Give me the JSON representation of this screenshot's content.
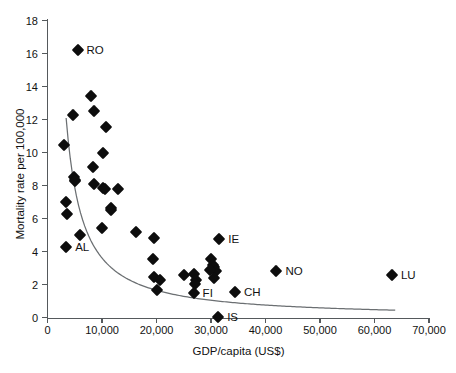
{
  "chart_data": {
    "type": "scatter",
    "title": "",
    "xlabel": "GDP/capita (US$)",
    "ylabel": "Mortality rate per 100,000",
    "xlim": [
      0,
      70000
    ],
    "ylim": [
      0,
      18
    ],
    "xticks": [
      0,
      10000,
      20000,
      30000,
      40000,
      50000,
      60000,
      70000
    ],
    "xticklabels": [
      "0",
      "10,000",
      "20,000",
      "30,000",
      "40,000",
      "50,000",
      "60,000",
      "70,000"
    ],
    "yticks": [
      0,
      2,
      4,
      6,
      8,
      10,
      12,
      14,
      16,
      18
    ],
    "yticklabels": [
      "0",
      "2",
      "4",
      "6",
      "8",
      "10",
      "12",
      "14",
      "16",
      "18"
    ],
    "grid": false,
    "legend": null,
    "marker": "diamond",
    "marker_color": "#0d0d0d",
    "trendline": {
      "style": "power-decay curve",
      "color": "#6b6f72",
      "x_start": 3400,
      "y_start": 12.1,
      "x_end": 63800,
      "y_end": 0.45
    },
    "points": [
      {
        "x": 3100,
        "y": 10.45,
        "label": ""
      },
      {
        "x": 3300,
        "y": 7.0,
        "label": ""
      },
      {
        "x": 3500,
        "y": 6.3,
        "label": ""
      },
      {
        "x": 3400,
        "y": 4.25,
        "label": "AL"
      },
      {
        "x": 5500,
        "y": 16.2,
        "label": "RO"
      },
      {
        "x": 4700,
        "y": 12.3,
        "label": ""
      },
      {
        "x": 4800,
        "y": 8.5,
        "label": ""
      },
      {
        "x": 5000,
        "y": 8.35,
        "label": ""
      },
      {
        "x": 5100,
        "y": 8.25,
        "label": ""
      },
      {
        "x": 5900,
        "y": 5.0,
        "label": ""
      },
      {
        "x": 8000,
        "y": 13.45,
        "label": ""
      },
      {
        "x": 8500,
        "y": 12.5,
        "label": ""
      },
      {
        "x": 8300,
        "y": 9.1,
        "label": ""
      },
      {
        "x": 8600,
        "y": 8.1,
        "label": ""
      },
      {
        "x": 9900,
        "y": 5.45,
        "label": ""
      },
      {
        "x": 10700,
        "y": 11.55,
        "label": ""
      },
      {
        "x": 10200,
        "y": 7.85,
        "label": ""
      },
      {
        "x": 10600,
        "y": 7.8,
        "label": ""
      },
      {
        "x": 10100,
        "y": 9.95,
        "label": ""
      },
      {
        "x": 11600,
        "y": 6.65,
        "label": ""
      },
      {
        "x": 11700,
        "y": 6.55,
        "label": ""
      },
      {
        "x": 12900,
        "y": 7.8,
        "label": ""
      },
      {
        "x": 16200,
        "y": 5.2,
        "label": ""
      },
      {
        "x": 19500,
        "y": 4.8,
        "label": ""
      },
      {
        "x": 19400,
        "y": 3.55,
        "label": ""
      },
      {
        "x": 19600,
        "y": 2.45,
        "label": ""
      },
      {
        "x": 20600,
        "y": 2.25,
        "label": ""
      },
      {
        "x": 20000,
        "y": 1.65,
        "label": ""
      },
      {
        "x": 25100,
        "y": 2.6,
        "label": ""
      },
      {
        "x": 26900,
        "y": 2.65,
        "label": ""
      },
      {
        "x": 27200,
        "y": 2.25,
        "label": ""
      },
      {
        "x": 27100,
        "y": 2.05,
        "label": ""
      },
      {
        "x": 26800,
        "y": 1.5,
        "label": "FI"
      },
      {
        "x": 29900,
        "y": 3.55,
        "label": ""
      },
      {
        "x": 30300,
        "y": 3.2,
        "label": ""
      },
      {
        "x": 30500,
        "y": 3.05,
        "label": ""
      },
      {
        "x": 30900,
        "y": 2.85,
        "label": ""
      },
      {
        "x": 30600,
        "y": 2.4,
        "label": ""
      },
      {
        "x": 29800,
        "y": 2.9,
        "label": ""
      },
      {
        "x": 31500,
        "y": 4.75,
        "label": "IE"
      },
      {
        "x": 31300,
        "y": 0.05,
        "label": "IS"
      },
      {
        "x": 34400,
        "y": 1.55,
        "label": "CH"
      },
      {
        "x": 42000,
        "y": 2.85,
        "label": "NO"
      },
      {
        "x": 63200,
        "y": 2.6,
        "label": "LU"
      }
    ]
  }
}
